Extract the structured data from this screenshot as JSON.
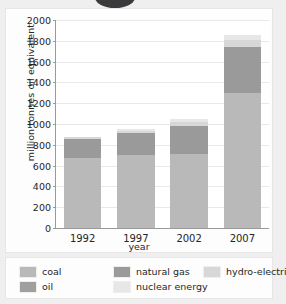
{
  "chart_data": {
    "type": "bar",
    "stacked": true,
    "title": "",
    "xlabel": "year",
    "ylabel": "million tonnes oil equivalent",
    "categories": [
      "1992",
      "1997",
      "2002",
      "2007"
    ],
    "ylim": [
      0,
      2000
    ],
    "yticks": [
      0,
      200,
      400,
      600,
      800,
      1000,
      1200,
      1400,
      1600,
      1800,
      2000
    ],
    "grid": true,
    "legend_position": "bottom",
    "series": [
      {
        "name": "coal",
        "color": "#b9b9b9",
        "values": [
          675,
          700,
          715,
          1300
        ]
      },
      {
        "name": "natural gas",
        "color": "#9a9a9a",
        "values": [
          185,
          210,
          270,
          440
        ]
      },
      {
        "name": "hydro-electricity",
        "color": "#d7d7d7",
        "values": [
          15,
          25,
          35,
          70
        ]
      },
      {
        "name": "nuclear energy",
        "color": "#e7e7e7",
        "values": [
          0,
          20,
          30,
          50
        ]
      }
    ],
    "totals": [
      875,
      955,
      1050,
      1860
    ]
  },
  "axes": {
    "y_title": "million tonnes oil equivalent",
    "x_title": "year",
    "y_tick_labels": [
      "2000",
      "1800",
      "1600",
      "1400",
      "1200",
      "1000",
      "800",
      "600",
      "400",
      "200",
      "0"
    ],
    "x_tick_labels": [
      "1992",
      "1997",
      "2002",
      "2007"
    ]
  },
  "legend": {
    "items": [
      {
        "label": "coal",
        "color": "#b9b9b9"
      },
      {
        "label": "natural gas",
        "color": "#9a9a9a"
      },
      {
        "label": "hydro-electricity",
        "color": "#d7d7d7"
      },
      {
        "label": "oil",
        "color": "#9f9f9f"
      },
      {
        "label": "nuclear energy",
        "color": "#e7e7e7"
      }
    ]
  },
  "colors": {
    "page_background": "#efeff0",
    "card_background": "#fdfdfd",
    "plot_background": "#ffffff",
    "axis_line": "#9a9a9a",
    "gridline": "#e9e9ea",
    "text": "#262626",
    "ellipse": "#3a3a3c"
  }
}
